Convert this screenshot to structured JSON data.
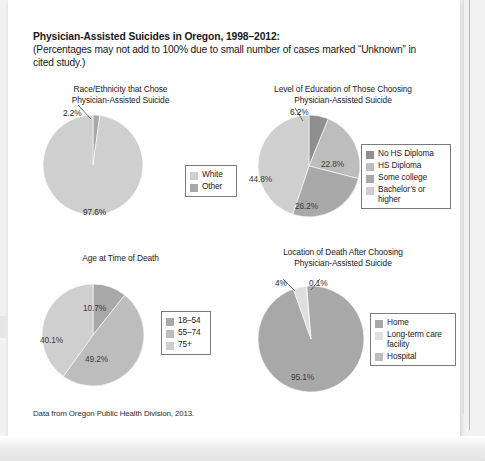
{
  "figure": {
    "title_line1": "Physician-Assisted Suicides in Oregon, 1998–2012:",
    "title_line2": "(Percentages may not add to 100% due to small number of cases marked “Unknown” in cited study.)",
    "source_note": "Data from Oregon Public Health Division, 2013."
  },
  "palette": {
    "dark_gray": "#8f8f8f",
    "mid_gray": "#a8a8a8",
    "light_gray": "#bdbdbd",
    "lighter_gray": "#cfcfcf",
    "lightest_gray": "#dedede",
    "legend_border": "#7b7b7b",
    "paper": "#ffffff",
    "scan_background": "#f2f2f2"
  },
  "chart_data": [
    {
      "id": "race-ethnicity",
      "type": "pie",
      "title": "Race/Ethnicity that Chose\nPhysician-Assisted Suicide",
      "categories": [
        "White",
        "Other"
      ],
      "values": [
        97.6,
        2.2
      ],
      "labels": [
        "97.6%",
        "2.2%"
      ],
      "colors": [
        "#cfcfcf",
        "#a8a8a8"
      ],
      "legend_position": "right",
      "legend": [
        {
          "label": "White",
          "color": "#cfcfcf"
        },
        {
          "label": "Other",
          "color": "#a8a8a8"
        }
      ]
    },
    {
      "id": "education-level",
      "type": "pie",
      "title": "Level of Education of Those Choosing\nPhysician-Assisted Suicide",
      "categories": [
        "No HS Diploma",
        "HS Diploma",
        "Some college",
        "Bachelor’s or higher"
      ],
      "values": [
        6.2,
        22.8,
        26.2,
        44.8
      ],
      "labels": [
        "6.2%",
        "22.8%",
        "26.2%",
        "44.8%"
      ],
      "colors": [
        "#8f8f8f",
        "#bdbdbd",
        "#a8a8a8",
        "#cfcfcf"
      ],
      "legend_position": "right",
      "legend": [
        {
          "label": "No HS Diploma",
          "color": "#8f8f8f"
        },
        {
          "label": "HS Diploma",
          "color": "#bdbdbd"
        },
        {
          "label": "Some college",
          "color": "#a8a8a8"
        },
        {
          "label": "Bachelor’s or\nhigher",
          "color": "#cfcfcf"
        }
      ]
    },
    {
      "id": "age-at-death",
      "type": "pie",
      "title": "Age at Time of Death",
      "categories": [
        "18–54",
        "55–74",
        "75+"
      ],
      "values": [
        10.7,
        49.2,
        40.1
      ],
      "labels": [
        "10.7%",
        "49.2%",
        "40.1%"
      ],
      "colors": [
        "#a8a8a8",
        "#bdbdbd",
        "#cfcfcf"
      ],
      "legend_position": "right",
      "legend": [
        {
          "label": "18–54",
          "color": "#a8a8a8"
        },
        {
          "label": "55–74",
          "color": "#bdbdbd"
        },
        {
          "label": "75+",
          "color": "#cfcfcf"
        }
      ]
    },
    {
      "id": "location-of-death",
      "type": "pie",
      "title": "Location of Death After Choosing\nPhysician-Assisted Suicide",
      "categories": [
        "Home",
        "Long-term care facility",
        "Hospital"
      ],
      "values": [
        95.1,
        4,
        0.1
      ],
      "labels": [
        "95.1%",
        "4%",
        "0.1%"
      ],
      "colors": [
        "#a8a8a8",
        "#dedede",
        "#bdbdbd"
      ],
      "legend_position": "right",
      "legend": [
        {
          "label": "Home",
          "color": "#a8a8a8"
        },
        {
          "label": "Long-term care\nfacility",
          "color": "#dedede"
        },
        {
          "label": "Hospital",
          "color": "#bdbdbd"
        }
      ]
    }
  ]
}
